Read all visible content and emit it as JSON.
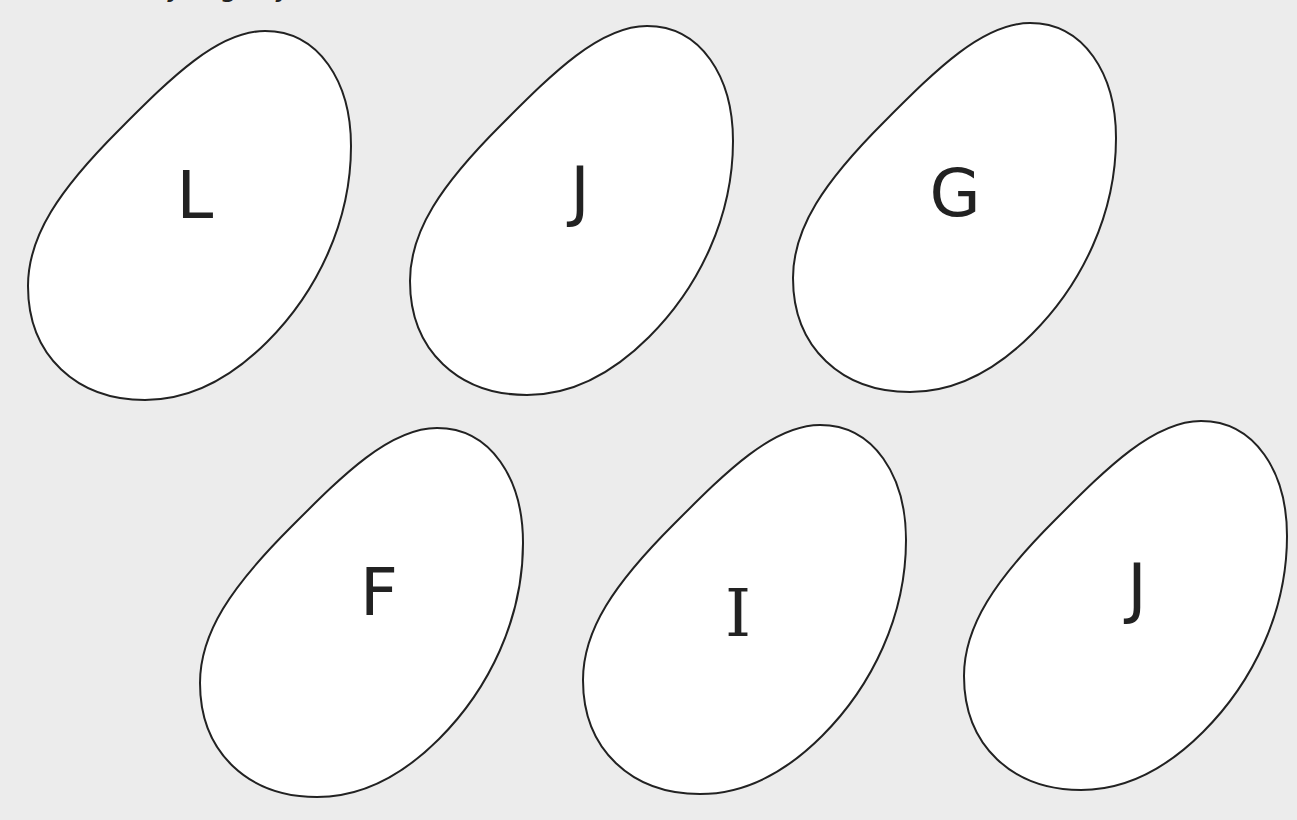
{
  "header": {
    "cutoff_text": "y g y"
  },
  "colors": {
    "background": "#ececec",
    "egg_fill": "#ffffff",
    "egg_stroke": "#222222",
    "letter": "#222222"
  },
  "eggs": [
    {
      "letter": "L",
      "x": 27,
      "y": 30,
      "letter_x": 168,
      "letter_y": 166
    },
    {
      "letter": "J",
      "x": 409,
      "y": 25,
      "letter_x": 171,
      "letter_y": 167
    },
    {
      "letter": "G",
      "x": 792,
      "y": 22,
      "letter_x": 163,
      "letter_y": 172
    },
    {
      "letter": "F",
      "x": 199,
      "y": 427,
      "letter_x": 180,
      "letter_y": 166
    },
    {
      "letter": "I",
      "x": 582,
      "y": 424,
      "letter_x": 156,
      "letter_y": 190
    },
    {
      "letter": "J",
      "x": 963,
      "y": 420,
      "letter_x": 174,
      "letter_y": 169
    }
  ]
}
